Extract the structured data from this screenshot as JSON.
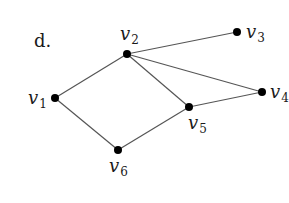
{
  "part_label": "d.",
  "graph": {
    "edge_color": "#555555",
    "node_color": "#000000",
    "nodes": [
      {
        "id": "v1",
        "base": "v",
        "sub": "1",
        "x": 55,
        "y": 98,
        "lx": 28,
        "ly": 104
      },
      {
        "id": "v2",
        "base": "v",
        "sub": "2",
        "x": 127,
        "y": 54,
        "lx": 120,
        "ly": 40
      },
      {
        "id": "v3",
        "base": "v",
        "sub": "3",
        "x": 237,
        "y": 32,
        "lx": 246,
        "ly": 38
      },
      {
        "id": "v4",
        "base": "v",
        "sub": "4",
        "x": 262,
        "y": 92,
        "lx": 270,
        "ly": 98
      },
      {
        "id": "v5",
        "base": "v",
        "sub": "5",
        "x": 189,
        "y": 107,
        "lx": 188,
        "ly": 129
      },
      {
        "id": "v6",
        "base": "v",
        "sub": "6",
        "x": 118,
        "y": 150,
        "lx": 109,
        "ly": 172
      }
    ],
    "edges": [
      [
        "v1",
        "v2"
      ],
      [
        "v1",
        "v6"
      ],
      [
        "v2",
        "v3"
      ],
      [
        "v2",
        "v4"
      ],
      [
        "v2",
        "v5"
      ],
      [
        "v5",
        "v4"
      ],
      [
        "v5",
        "v6"
      ]
    ]
  }
}
